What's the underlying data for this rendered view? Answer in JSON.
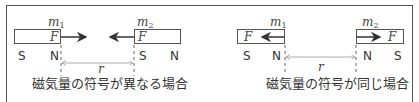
{
  "left_panel": {
    "mass1_label": "m",
    "mass1_sub": "1",
    "mass2_label": "m",
    "mass2_sub": "2",
    "force1": "F",
    "force2": "F",
    "magnet1_poles": [
      "S",
      "N"
    ],
    "magnet2_poles": [
      "S",
      "N"
    ],
    "distance_label": "r",
    "caption": "磁気量の符号が異なる場合"
  },
  "right_panel": {
    "mass1_label": "m",
    "mass1_sub": "1",
    "mass2_label": "m",
    "mass2_sub": "2",
    "force1": "F",
    "force2": "F",
    "magnet1_poles": [
      "S",
      "N"
    ],
    "magnet2_poles": [
      "N",
      "S"
    ],
    "distance_label": "r",
    "caption": "磁気量の符号が同じ場合"
  },
  "colors": {
    "stroke": "#555555",
    "text": "#333333",
    "dimension_line": "#9a9a9a"
  }
}
